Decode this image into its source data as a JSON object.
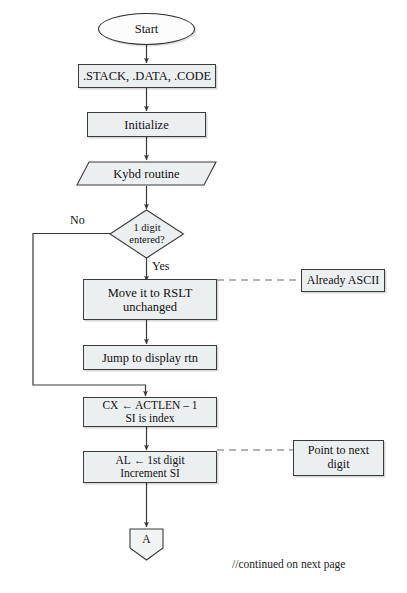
{
  "diagram": {
    "colors": {
      "node_fill": "#eceff0",
      "node_border": "#3b3b3b",
      "terminator_fill": "#fcfcfc",
      "line": "#3a3a3a",
      "dashed_line": "#9a9a9a",
      "text": "#111111"
    },
    "nodes": {
      "start": {
        "label": "Start",
        "shape": "ellipse"
      },
      "segments": {
        "label": ".STACK, .DATA, .CODE",
        "shape": "process"
      },
      "initialize": {
        "label": "Initialize",
        "shape": "process"
      },
      "kybd": {
        "label": "Kybd routine",
        "shape": "input-output"
      },
      "decision": {
        "line1": "1 digit",
        "line2": "entered?",
        "shape": "decision"
      },
      "move_rslt": {
        "line1": "Move it to RSLT",
        "line2": "unchanged",
        "shape": "process"
      },
      "jump_display": {
        "label": "Jump to display rtn",
        "shape": "process"
      },
      "cx_actlen": {
        "line1_a": "CX",
        "line1_arrow": "←",
        "line1_b": "ACTLEN – 1",
        "line2": "SI is index",
        "shape": "process"
      },
      "al_digit": {
        "line1_a": "AL",
        "line1_arrow": "←",
        "line1_b": "1st digit",
        "line2": "Increment SI",
        "shape": "process"
      },
      "connector_a": {
        "label": "A",
        "shape": "off-page-connector"
      }
    },
    "side_notes": {
      "already_ascii": {
        "label": "Already ASCII"
      },
      "point_next": {
        "line1": "Point to next",
        "line2": "digit"
      }
    },
    "edge_labels": {
      "no": "No",
      "yes": "Yes"
    },
    "footnote": "//continued on next page"
  }
}
